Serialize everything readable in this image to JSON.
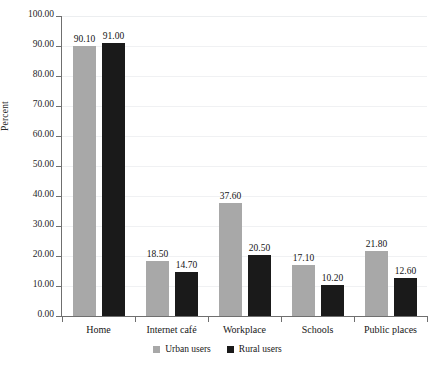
{
  "chart_data": {
    "type": "bar",
    "title": "",
    "subtitle": "",
    "xlabel": "",
    "ylabel": "Percent",
    "ylim": [
      0,
      100
    ],
    "ytick_step": 10,
    "grid": true,
    "legend_position": "bottom-center",
    "categories": [
      "Home",
      "Internet café",
      "Workplace",
      "Schools",
      "Public places"
    ],
    "ytick_labels": [
      "0.00",
      "10.00",
      "20.00",
      "30.00",
      "40.00",
      "50.00",
      "60.00",
      "70.00",
      "80.00",
      "90.00",
      "100.00"
    ],
    "series": [
      {
        "name": "Urban users",
        "color": "#a8a8a8",
        "values": [
          90.1,
          18.5,
          37.6,
          17.1,
          21.8
        ],
        "labels": [
          "90.10",
          "18.50",
          "37.60",
          "17.10",
          "21.80"
        ]
      },
      {
        "name": "Rural users",
        "color": "#1a1a1a",
        "values": [
          91.0,
          14.7,
          20.5,
          10.2,
          12.6
        ],
        "labels": [
          "91.00",
          "14.70",
          "20.50",
          "10.20",
          "12.60"
        ]
      }
    ]
  },
  "legend": {
    "items": [
      {
        "label": "Urban users",
        "color": "#a8a8a8"
      },
      {
        "label": "Rural users",
        "color": "#1a1a1a"
      }
    ]
  },
  "colors": {
    "urban": "#a8a8a8",
    "rural": "#1a1a1a",
    "axis": "#6f6f6f",
    "gridline": "#f0f1f3",
    "background": "#ffffff"
  }
}
